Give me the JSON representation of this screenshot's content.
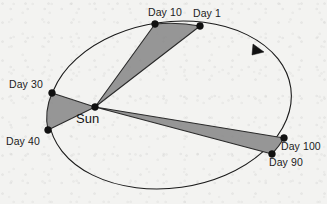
{
  "figure": {
    "background_color": "#f3f3f1",
    "stroke_color": "#1a1a1a",
    "sweep_fill_color": "#969696"
  },
  "central_body": {
    "label": "Sun",
    "point": {
      "x": 95,
      "y": 107
    },
    "label_position": {
      "x": 76,
      "y": 112
    }
  },
  "orbit": {
    "shape": "ellipse",
    "center": {
      "x": 170,
      "y": 105
    },
    "radius_x": 122,
    "radius_y": 83,
    "rotation_deg": -8,
    "direction": "counterclockwise",
    "arrow_label": "orbital-direction-arrow"
  },
  "nodes": [
    {
      "id": "day-1",
      "label": "Day 1",
      "point": {
        "x": 200,
        "y": 26
      },
      "label_position": {
        "x": 193,
        "y": 8
      }
    },
    {
      "id": "day-10",
      "label": "Day 10",
      "point": {
        "x": 155,
        "y": 24
      },
      "label_position": {
        "x": 148,
        "y": 7
      }
    },
    {
      "id": "day-30",
      "label": "Day 30",
      "point": {
        "x": 52,
        "y": 93
      },
      "label_position": {
        "x": 9,
        "y": 79
      }
    },
    {
      "id": "day-40",
      "label": "Day 40",
      "point": {
        "x": 48,
        "y": 130
      },
      "label_position": {
        "x": 6,
        "y": 136
      }
    },
    {
      "id": "day-90",
      "label": "Day 90",
      "point": {
        "x": 272,
        "y": 154
      },
      "label_position": {
        "x": 269,
        "y": 157
      }
    },
    {
      "id": "day-100",
      "label": "Day 100",
      "point": {
        "x": 284,
        "y": 138
      },
      "label_position": {
        "x": 281,
        "y": 141
      }
    }
  ],
  "swept_areas": [
    {
      "id": "sweep-day1-day10",
      "name": "sector-day-1-to-day-10",
      "from_node": "Day 1",
      "to_node": "Day 10",
      "description": "Shaded sector swept between Day 1 and Day 10"
    },
    {
      "id": "sweep-day30-day40",
      "name": "sector-day-30-to-day-40",
      "from_node": "Day 30",
      "to_node": "Day 40",
      "description": "Shaded sector swept between Day 30 and Day 40"
    },
    {
      "id": "sweep-day90-day100",
      "name": "sector-day-90-to-day-100",
      "from_node": "Day 90",
      "to_node": "Day 100",
      "description": "Shaded sector swept between Day 90 and Day 100"
    }
  ]
}
